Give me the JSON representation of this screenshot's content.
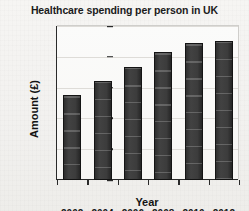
{
  "chart_data": {
    "type": "bar",
    "title": "Healthcare spending per person in UK",
    "xlabel": "Year",
    "ylabel": "Amount (£)",
    "categories": [
      "2002",
      "2004",
      "2006",
      "2008",
      "2010",
      "2012"
    ],
    "values": [
      1380,
      1600,
      1840,
      2070,
      2220,
      2250
    ],
    "ylim": [
      0,
      2500
    ],
    "yticks": [
      0,
      500,
      1000,
      1500,
      2000,
      2500
    ],
    "ytick_labels": [
      "0",
      "500",
      "1000",
      "1500",
      "2000",
      "2500"
    ],
    "grid": true,
    "legend": null,
    "bar_color": "#3a3a3a",
    "axis_color": "#2a2a2a",
    "background_color": "#f4f3f1"
  }
}
